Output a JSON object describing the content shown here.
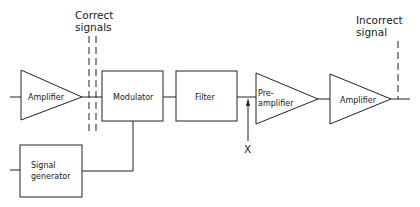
{
  "diagram": {
    "title": "",
    "blocks": [
      {
        "id": "amp1",
        "type": "amplifier",
        "label": "Amplifier"
      },
      {
        "id": "mod",
        "type": "box",
        "label": "Modulator"
      },
      {
        "id": "filter",
        "type": "box",
        "label": "Filter"
      },
      {
        "id": "preamp",
        "type": "amplifier",
        "label_line1": "Pre-",
        "label_line2": "amplifier"
      },
      {
        "id": "amp2",
        "type": "amplifier",
        "label": "Amplifier"
      },
      {
        "id": "siggen",
        "type": "box",
        "label_line1": "Signal",
        "label_line2": "generator"
      }
    ],
    "annotations": {
      "correct_line1": "Correct",
      "correct_line2": "signals",
      "incorrect_line1": "Incorrect",
      "incorrect_line2": "signal",
      "test_point": "X"
    },
    "connections": [
      [
        "input",
        "amp1"
      ],
      [
        "amp1",
        "mod"
      ],
      [
        "mod",
        "filter"
      ],
      [
        "filter",
        "preamp"
      ],
      [
        "preamp",
        "amp2"
      ],
      [
        "amp2",
        "output"
      ],
      [
        "input2",
        "siggen"
      ],
      [
        "siggen",
        "mod"
      ]
    ]
  }
}
